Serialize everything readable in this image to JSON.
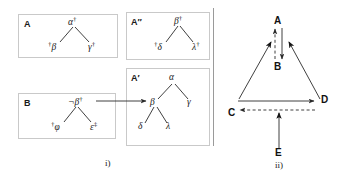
{
  "figure": {
    "panel_i": {
      "caption": "i)",
      "boxes": [
        {
          "id": "A",
          "label": "A",
          "tree": {
            "root": {
              "text": "α",
              "post": "†",
              "pre": ""
            },
            "children": [
              {
                "text": "β",
                "pre": "†",
                "post": ""
              },
              {
                "text": "γ",
                "pre": "",
                "post": "†"
              }
            ]
          }
        },
        {
          "id": "A2",
          "label": "A″",
          "tree": {
            "root": {
              "text": "β",
              "post": "†",
              "pre": ""
            },
            "children": [
              {
                "text": "δ",
                "pre": "†",
                "post": ""
              },
              {
                "text": "λ",
                "pre": "",
                "post": "†"
              }
            ]
          }
        },
        {
          "id": "B",
          "label": "B",
          "tree": {
            "root": {
              "text": "¬β",
              "post": "†",
              "pre": ""
            },
            "children": [
              {
                "text": "φ",
                "pre": "†",
                "post": ""
              },
              {
                "text": "ε",
                "pre": "",
                "post": "‡"
              }
            ]
          }
        },
        {
          "id": "A1",
          "label": "A′",
          "tree": {
            "root": {
              "text": "α",
              "pre": "",
              "post": ""
            },
            "children": [
              {
                "text": "β",
                "pre": "",
                "post": ""
              },
              {
                "text": "γ",
                "pre": "",
                "post": ""
              }
            ],
            "grandchildren": [
              {
                "text": "δ",
                "pre": "",
                "post": ""
              },
              {
                "text": "λ",
                "pre": "",
                "post": ""
              }
            ]
          }
        }
      ],
      "resolution_arrow": {
        "from": "B.root",
        "to": "A1.beta",
        "style": "solid"
      }
    },
    "panel_ii": {
      "caption": "ii)",
      "nodes": [
        {
          "id": "A",
          "label": "A"
        },
        {
          "id": "B",
          "label": "B"
        },
        {
          "id": "C",
          "label": "C"
        },
        {
          "id": "D",
          "label": "D"
        },
        {
          "id": "E",
          "label": "E"
        }
      ],
      "edges": [
        {
          "from": "A",
          "to": "B",
          "style": "solid"
        },
        {
          "from": "B",
          "to": "A",
          "style": "dashed"
        },
        {
          "from": "C",
          "to": "A",
          "style": "solid"
        },
        {
          "from": "D",
          "to": "A",
          "style": "solid"
        },
        {
          "from": "C",
          "to": "D",
          "style": "solid"
        },
        {
          "from": "D",
          "to": "C",
          "style": "dashed"
        },
        {
          "from": "E",
          "to": "CD",
          "style": "solid"
        }
      ]
    }
  },
  "colors": {
    "ink": "#1a1a1a",
    "edge": "#2a2a2a",
    "box_border": "#c9c9c9",
    "divider": "#9a9a9a",
    "background": "#ffffff"
  }
}
